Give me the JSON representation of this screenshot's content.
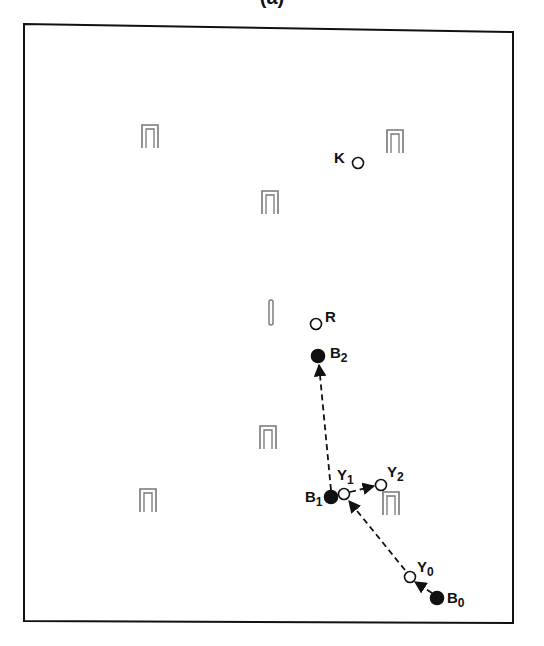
{
  "title": "(a)",
  "colors": {
    "ink": "#111111",
    "background": "#ffffff",
    "hoop": "#777777"
  },
  "frame": {
    "x1": 24,
    "y1": 24,
    "x2": 513,
    "y2": 621
  },
  "hoops": [
    {
      "id": "hoop-1",
      "x": 150,
      "y": 136
    },
    {
      "id": "hoop-2",
      "x": 395,
      "y": 141
    },
    {
      "id": "hoop-3",
      "x": 270,
      "y": 202
    },
    {
      "id": "hoop-4",
      "x": 268,
      "y": 437
    },
    {
      "id": "hoop-5",
      "x": 148,
      "y": 500
    },
    {
      "id": "hoop-6",
      "x": 391,
      "y": 503
    }
  ],
  "peg": {
    "x": 271,
    "y": 312
  },
  "balls": [
    {
      "id": "K",
      "label": "K",
      "sub": "",
      "x": 358,
      "y": 163,
      "filled": false,
      "lx": 334,
      "ly": 163
    },
    {
      "id": "R",
      "label": "R",
      "sub": "",
      "x": 316,
      "y": 324,
      "filled": false,
      "lx": 325,
      "ly": 322
    },
    {
      "id": "B2",
      "label": "B",
      "sub": "2",
      "x": 318,
      "y": 356,
      "filled": true,
      "lx": 330,
      "ly": 358
    },
    {
      "id": "B1",
      "label": "B",
      "sub": "1",
      "x": 331,
      "y": 497,
      "filled": true,
      "lx": 305,
      "ly": 502
    },
    {
      "id": "Y1",
      "label": "Y",
      "sub": "1",
      "x": 344,
      "y": 494,
      "filled": false,
      "lx": 337,
      "ly": 480
    },
    {
      "id": "Y2",
      "label": "Y",
      "sub": "2",
      "x": 381,
      "y": 485,
      "filled": false,
      "lx": 387,
      "ly": 477
    },
    {
      "id": "Y0",
      "label": "Y",
      "sub": "0",
      "x": 410,
      "y": 577,
      "filled": false,
      "lx": 417,
      "ly": 572
    },
    {
      "id": "B0",
      "label": "B",
      "sub": "0",
      "x": 437,
      "y": 598,
      "filled": true,
      "lx": 447,
      "ly": 603
    }
  ],
  "arrows": [
    {
      "id": "B1-to-B2",
      "from": [
        331,
        490
      ],
      "to": [
        319,
        365
      ]
    },
    {
      "id": "Y1-to-Y2",
      "from": [
        350,
        492
      ],
      "to": [
        374,
        486
      ]
    },
    {
      "id": "Y0-to-Y1",
      "from": [
        405,
        570
      ],
      "to": [
        349,
        501
      ]
    },
    {
      "id": "B0-to-Y0",
      "from": [
        432,
        593
      ],
      "to": [
        415,
        582
      ]
    }
  ]
}
